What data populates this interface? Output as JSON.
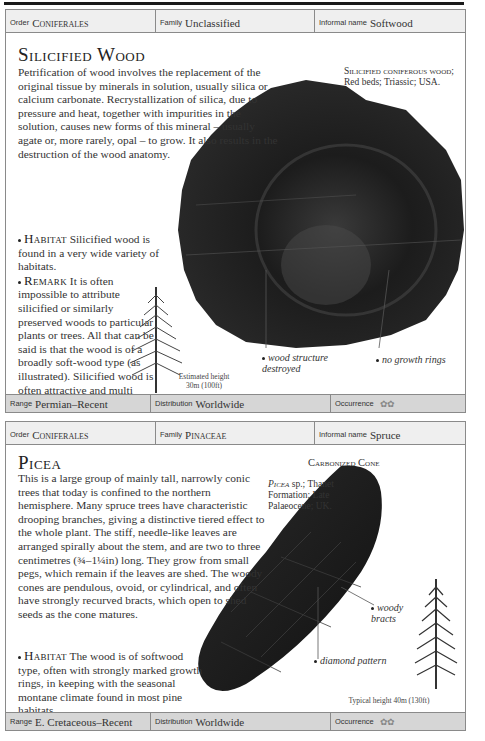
{
  "entries": [
    {
      "header": {
        "order_label": "Order",
        "order_value": "Coniferales",
        "family_label": "Family",
        "family_value": "Unclassified",
        "informal_label": "Informal name",
        "informal_value": "Softwood"
      },
      "title": "Silicified Wood",
      "intro": "Petrification of wood involves the replacement of the original tissue by minerals in solution, usually silica or calcium carbonate. Recrystallization of silica, due to pressure and heat, together with impurities in the solution, causes new forms of this mineral – usually agate or, more rarely, opal – to grow. It also results in the destruction of the wood anatomy.",
      "habitat_label": "Habitat",
      "habitat_text": "Silicified wood is found in a very wide variety of habitats.",
      "remark_label": "Remark",
      "remark_text": "It is often impossible to attribute silicified or similarly preserved woods to particular plants or trees. All that can be said is that the wood is of a broadly soft-wood type (as illustrated). Silicified wood is often attractive and multi coloured.",
      "specimen_caption_sc": "Silicified coniferous wood;",
      "specimen_caption_rest": "Red beds; Triassic; USA.",
      "annotations": [
        "wood structure destroyed",
        "no growth rings"
      ],
      "tree_height_line1": "Estimated height",
      "tree_height_line2": "30m (100ft)",
      "footer": {
        "range_label": "Range",
        "range_value": "Permian–Recent",
        "distribution_label": "Distribution",
        "distribution_value": "Worldwide",
        "occurrence_label": "Occurrence",
        "occurrence_icons": "✿✿"
      }
    },
    {
      "header": {
        "order_label": "Order",
        "order_value": "Coniferales",
        "family_label": "Family",
        "family_value": "Pinaceae",
        "informal_label": "Informal name",
        "informal_value": "Spruce"
      },
      "title": "Picea",
      "specimen_title": "Carbonized Cone",
      "intro": "This is a large group of mainly tall, narrowly conic trees that today is confined to the northern hemisphere. Many spruce trees have characteristic drooping branches, giving a distinctive tiered effect to the whole plant. The stiff, needle-like leaves are arranged spirally about the stem, and are two to three centimetres (¾–1¼in) long. They grow from small pegs, which remain if the leaves are shed. The woody cones are pendulous, ovoid, or cylindrical, and often have strongly recurved bracts, which open to shed seeds as the cone matures.",
      "habitat_label": "Habitat",
      "habitat_text": "The wood is of softwood type, often with strongly marked growth rings, in keeping with the seasonal montane climate found in most pine habitats.",
      "specimen_caption_sc": "Picea",
      "specimen_caption_rest": "sp.; Thanet Formation; Late Palaeocene; UK.",
      "annotations": [
        "woody bracts",
        "diamond pattern"
      ],
      "tree_height": "Typical height 40m (130ft)",
      "footer": {
        "range_label": "Range",
        "range_value": "E. Cretaceous–Recent",
        "distribution_label": "Distribution",
        "distribution_value": "Worldwide",
        "occurrence_label": "Occurrence",
        "occurrence_icons": "✿✿"
      }
    }
  ]
}
